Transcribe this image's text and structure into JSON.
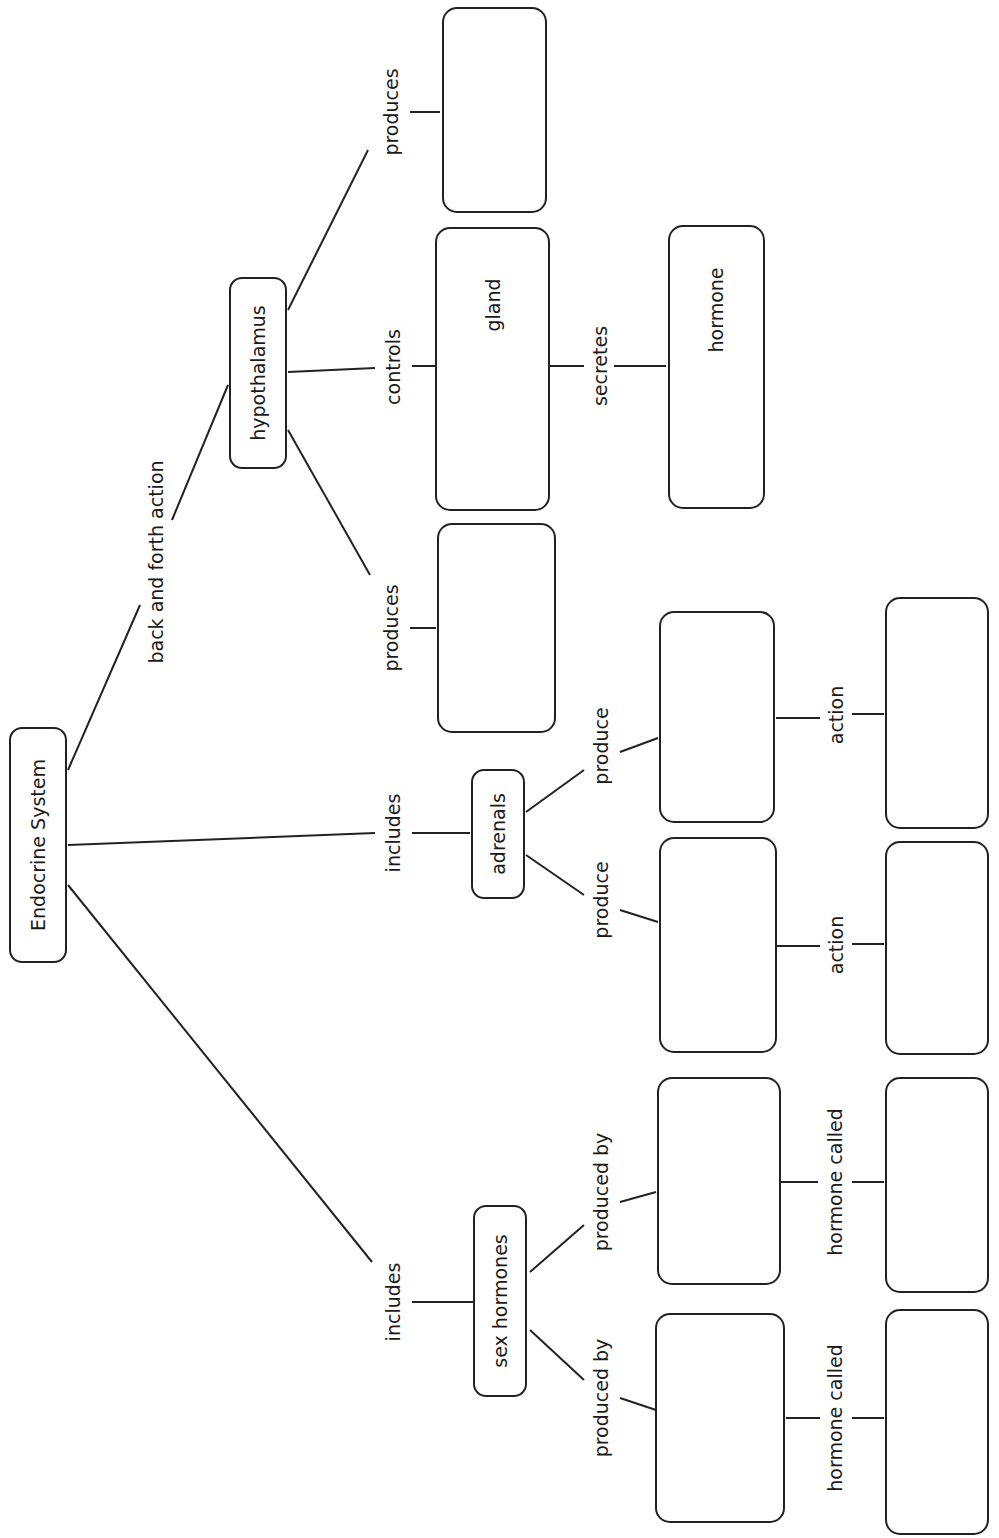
{
  "diagram": {
    "title": "Endocrine System",
    "nodes": {
      "root": "Endocrine System",
      "hypothalamus": "hypothalamus",
      "gland": "gland",
      "hormone": "hormone",
      "adrenals": "adrenals",
      "sex_hormones": "sex hormones",
      "blank": ""
    },
    "links": {
      "back_and_forth": "back and forth action",
      "includes_adrenals": "includes",
      "includes_sex": "includes",
      "produces_top": "produces",
      "controls": "controls",
      "produces_bottom": "produces",
      "secretes": "secretes",
      "adrenal_produce_1": "produce",
      "adrenal_produce_2": "produce",
      "adrenal_action_1": "action",
      "adrenal_action_2": "action",
      "sex_produced_by_1": "produced by",
      "sex_produced_by_2": "produced by",
      "sex_hormone_called_1": "hormone called",
      "sex_hormone_called_2": "hormone called"
    },
    "colors": {
      "stroke": "#222222",
      "background": "#ffffff",
      "text": "#1a1a1a"
    }
  }
}
